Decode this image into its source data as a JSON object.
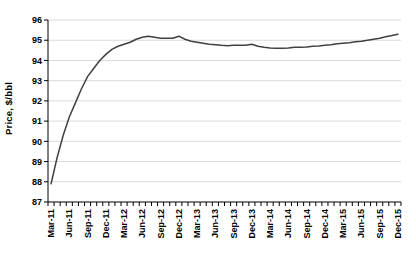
{
  "chart_data": {
    "type": "line",
    "title": "",
    "ylabel": "Price, $/bbl",
    "xlabel": "",
    "ylim": [
      87,
      96
    ],
    "y_tick_step": 1,
    "y_tick_labels": [
      "87",
      "88",
      "89",
      "90",
      "91",
      "92",
      "93",
      "94",
      "95",
      "96"
    ],
    "x_tick_labels": [
      "Mar-11",
      "Jun-11",
      "Sep-11",
      "Dec-11",
      "Mar-12",
      "Jun-12",
      "Sep-12",
      "Dec-12",
      "Mar-13",
      "Jun-13",
      "Sep-13",
      "Dec-13",
      "Mar-14",
      "Jun-14",
      "Sep-14",
      "Dec-14",
      "Mar-15",
      "Jun-15",
      "Sep-15",
      "Dec-15"
    ],
    "x_label_every_n_months": 3,
    "grid": "horizontal",
    "legend": "none",
    "series": [
      {
        "name": "Price",
        "months": [
          "Mar-11",
          "Apr-11",
          "May-11",
          "Jun-11",
          "Jul-11",
          "Aug-11",
          "Sep-11",
          "Oct-11",
          "Nov-11",
          "Dec-11",
          "Jan-12",
          "Feb-12",
          "Mar-12",
          "Apr-12",
          "May-12",
          "Jun-12",
          "Jul-12",
          "Aug-12",
          "Sep-12",
          "Oct-12",
          "Nov-12",
          "Dec-12",
          "Jan-13",
          "Feb-13",
          "Mar-13",
          "Apr-13",
          "May-13",
          "Jun-13",
          "Jul-13",
          "Aug-13",
          "Sep-13",
          "Oct-13",
          "Nov-13",
          "Dec-13",
          "Jan-14",
          "Feb-14",
          "Mar-14",
          "Apr-14",
          "May-14",
          "Jun-14",
          "Jul-14",
          "Aug-14",
          "Sep-14",
          "Oct-14",
          "Nov-14",
          "Dec-14",
          "Jan-15",
          "Feb-15",
          "Mar-15",
          "Apr-15",
          "May-15",
          "Jun-15",
          "Jul-15",
          "Aug-15",
          "Sep-15",
          "Oct-15",
          "Nov-15",
          "Dec-15"
        ],
        "values": [
          87.9,
          89.2,
          90.3,
          91.2,
          91.9,
          92.6,
          93.2,
          93.6,
          94.0,
          94.3,
          94.55,
          94.7,
          94.8,
          94.9,
          95.05,
          95.15,
          95.2,
          95.15,
          95.1,
          95.1,
          95.1,
          95.2,
          95.05,
          94.95,
          94.9,
          94.85,
          94.8,
          94.78,
          94.75,
          94.73,
          94.75,
          94.75,
          94.75,
          94.8,
          94.7,
          94.65,
          94.62,
          94.6,
          94.6,
          94.62,
          94.65,
          94.65,
          94.67,
          94.7,
          94.72,
          94.75,
          94.78,
          94.82,
          94.85,
          94.88,
          94.92,
          94.95,
          95.0,
          95.05,
          95.1,
          95.17,
          95.23,
          95.3
        ]
      }
    ],
    "colors": {
      "line": "#404040",
      "gridline": "#d9d9d9",
      "axis": "#000000",
      "text": "#000000",
      "background": "#ffffff"
    }
  }
}
